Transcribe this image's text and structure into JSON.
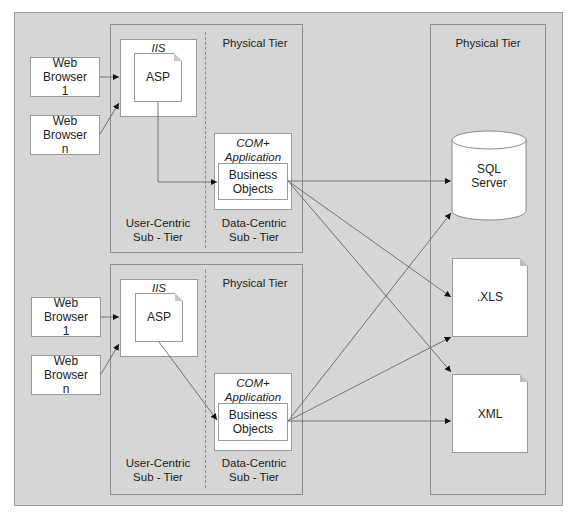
{
  "diagram": {
    "outer_background": "#d6d6d6",
    "right_tier": {
      "title": "Physical Tier"
    },
    "top_group": {
      "tier_title": "Physical Tier",
      "browsers": [
        {
          "label": "Web Browser 1",
          "line1": "Web",
          "line2": "Browser",
          "line3": "1"
        },
        {
          "label": "Web Browser n",
          "line1": "Web",
          "line2": "Browser",
          "line3": "n"
        }
      ],
      "iis_label": "IIS",
      "asp_label": "ASP",
      "com_line1": "COM+",
      "com_line2": "Application",
      "bo_line1": "Business",
      "bo_line2": "Objects",
      "user_sub_line1": "User-Centric",
      "user_sub_line2": "Sub - Tier",
      "data_sub_line1": "Data-Centric",
      "data_sub_line2": "Sub - Tier"
    },
    "bottom_group": {
      "tier_title": "Physical Tier",
      "browsers": [
        {
          "label": "Web Browser 1",
          "line1": "Web",
          "line2": "Browser",
          "line3": "1"
        },
        {
          "label": "Web Browser n",
          "line1": "Web",
          "line2": "Browser",
          "line3": "n"
        }
      ],
      "iis_label": "IIS",
      "asp_label": "ASP",
      "com_line1": "COM+",
      "com_line2": "Application",
      "bo_line1": "Business",
      "bo_line2": "Objects",
      "user_sub_line1": "User-Centric",
      "user_sub_line2": "Sub - Tier",
      "data_sub_line1": "Data-Centric",
      "data_sub_line2": "Sub - Tier"
    },
    "data_stores": {
      "sql_line1": "SQL",
      "sql_line2": "Server",
      "xls_label": ".XLS",
      "xml_label": "XML"
    }
  }
}
